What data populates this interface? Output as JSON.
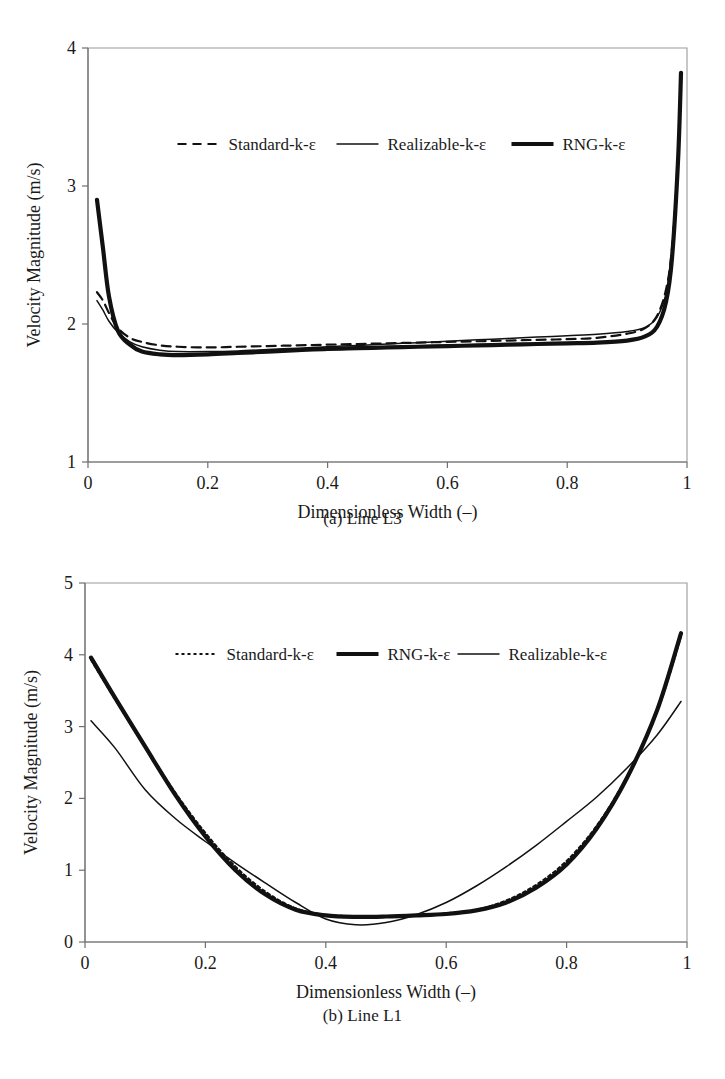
{
  "figure": {
    "panels": [
      {
        "id": "a",
        "caption": "(a) Line L3"
      },
      {
        "id": "b",
        "caption": "(b) Line L1"
      }
    ]
  },
  "chart_data": [
    {
      "type": "line",
      "panel": "a",
      "title": "",
      "caption": "(a) Line L3",
      "xlabel": "Dimensionless Width (–)",
      "ylabel": "Velocity Magnitude (m/s)",
      "xlim": [
        0,
        1
      ],
      "ylim": [
        1,
        4
      ],
      "xticks": [
        "0",
        "0.2",
        "0.4",
        "0.6",
        "0.8",
        "1"
      ],
      "xtick_values": [
        0,
        0.2,
        0.4,
        0.6,
        0.8,
        1
      ],
      "yticks": [
        "1",
        "2",
        "3",
        "4"
      ],
      "ytick_values": [
        1,
        2,
        3,
        4
      ],
      "grid": false,
      "legend_position": "upper-center-inside",
      "legend": [
        {
          "name": "Standard-k-ε",
          "style": "dashed"
        },
        {
          "name": "Realizable-k-ε",
          "style": "thin-solid"
        },
        {
          "name": "RNG-k-ε",
          "style": "thick-solid"
        }
      ],
      "x": [
        0.015,
        0.025,
        0.035,
        0.05,
        0.07,
        0.09,
        0.12,
        0.15,
        0.2,
        0.25,
        0.3,
        0.35,
        0.4,
        0.45,
        0.5,
        0.55,
        0.6,
        0.65,
        0.7,
        0.75,
        0.8,
        0.85,
        0.9,
        0.93,
        0.95,
        0.965,
        0.975,
        0.985,
        0.99
      ],
      "series": [
        {
          "name": "Standard-k-ε",
          "style": "dashed",
          "values": [
            2.23,
            2.17,
            2.08,
            1.97,
            1.9,
            1.87,
            1.845,
            1.835,
            1.83,
            1.835,
            1.84,
            1.845,
            1.85,
            1.855,
            1.86,
            1.865,
            1.87,
            1.875,
            1.88,
            1.885,
            1.89,
            1.9,
            1.93,
            1.97,
            2.06,
            2.25,
            2.55,
            3.2,
            3.78
          ]
        },
        {
          "name": "Realizable-k-ε",
          "style": "thin-solid",
          "values": [
            2.17,
            2.1,
            2.02,
            1.94,
            1.87,
            1.835,
            1.81,
            1.8,
            1.8,
            1.805,
            1.815,
            1.825,
            1.835,
            1.845,
            1.855,
            1.865,
            1.875,
            1.885,
            1.895,
            1.905,
            1.915,
            1.925,
            1.945,
            1.975,
            2.05,
            2.22,
            2.52,
            3.18,
            3.8
          ]
        },
        {
          "name": "RNG-k-ε",
          "style": "thick-solid",
          "values": [
            2.9,
            2.55,
            2.2,
            1.95,
            1.85,
            1.8,
            1.78,
            1.775,
            1.78,
            1.79,
            1.8,
            1.81,
            1.82,
            1.825,
            1.83,
            1.835,
            1.84,
            1.845,
            1.85,
            1.855,
            1.86,
            1.865,
            1.88,
            1.91,
            1.98,
            2.16,
            2.48,
            3.18,
            3.82
          ]
        }
      ]
    },
    {
      "type": "line",
      "panel": "b",
      "title": "",
      "caption": "(b) Line L1",
      "xlabel": "Dimensionless Width (–)",
      "ylabel": "Velocity Magnitude (m/s)",
      "xlim": [
        0,
        1
      ],
      "ylim": [
        0,
        5
      ],
      "xticks": [
        "0",
        "0.2",
        "0.4",
        "0.6",
        "0.8",
        "1"
      ],
      "xtick_values": [
        0,
        0.2,
        0.4,
        0.6,
        0.8,
        1
      ],
      "yticks": [
        "0",
        "1",
        "2",
        "3",
        "4",
        "5"
      ],
      "ytick_values": [
        0,
        1,
        2,
        3,
        4,
        5
      ],
      "grid": false,
      "legend_position": "upper-center-inside",
      "legend": [
        {
          "name": "Standard-k-ε",
          "style": "dotted"
        },
        {
          "name": "RNG-k-ε",
          "style": "thick-solid"
        },
        {
          "name": "Realizable-k-ε",
          "style": "thin-solid"
        }
      ],
      "x": [
        0.01,
        0.05,
        0.1,
        0.15,
        0.2,
        0.25,
        0.3,
        0.35,
        0.4,
        0.45,
        0.5,
        0.55,
        0.6,
        0.65,
        0.7,
        0.75,
        0.8,
        0.85,
        0.9,
        0.95,
        0.99
      ],
      "series": [
        {
          "name": "Standard-k-ε",
          "style": "dotted",
          "values": [
            3.93,
            3.38,
            2.72,
            2.08,
            1.52,
            1.05,
            0.7,
            0.47,
            0.38,
            0.36,
            0.36,
            0.37,
            0.4,
            0.45,
            0.58,
            0.8,
            1.13,
            1.62,
            2.3,
            3.2,
            4.25
          ]
        },
        {
          "name": "RNG-k-ε",
          "style": "thick-solid",
          "values": [
            3.96,
            3.4,
            2.72,
            2.05,
            1.47,
            1.0,
            0.66,
            0.45,
            0.37,
            0.35,
            0.355,
            0.37,
            0.39,
            0.44,
            0.55,
            0.76,
            1.08,
            1.58,
            2.28,
            3.22,
            4.3
          ]
        },
        {
          "name": "Realizable-k-ε",
          "style": "thin-solid",
          "values": [
            3.08,
            2.7,
            2.12,
            1.72,
            1.4,
            1.1,
            0.82,
            0.55,
            0.32,
            0.24,
            0.27,
            0.38,
            0.55,
            0.78,
            1.05,
            1.35,
            1.68,
            2.02,
            2.42,
            2.88,
            3.35
          ]
        }
      ]
    }
  ]
}
